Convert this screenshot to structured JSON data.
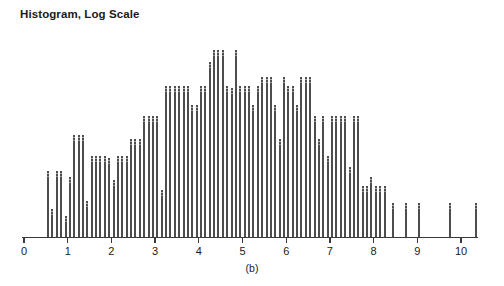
{
  "chart_data": {
    "type": "bar",
    "title": "Histogram, Log Scale",
    "subcaption": "(b)",
    "xlabel": "",
    "ylabel": "",
    "xlim": [
      0,
      10.6
    ],
    "ylim": [
      0,
      100
    ],
    "grid": false,
    "legend": null,
    "bin_width": 0.1,
    "bar_color": "#4d4d4d",
    "axis_color": "#3a3a3a",
    "background_color": "#ffffff",
    "x_tick_labels": [
      "0",
      "1",
      "2",
      "3",
      "4",
      "5",
      "6",
      "7",
      "8",
      "9",
      "10"
    ],
    "x_tick_values": [
      0,
      1,
      2,
      3,
      4,
      5,
      6,
      7,
      8,
      9,
      10
    ],
    "y_axis_visible": false,
    "note": "Counts are relative bar heights read off the plotted bars; vertical axis is unlabeled.",
    "x": [
      0.55,
      0.65,
      0.75,
      0.85,
      0.95,
      1.05,
      1.15,
      1.25,
      1.35,
      1.45,
      1.55,
      1.65,
      1.75,
      1.85,
      1.95,
      2.05,
      2.15,
      2.25,
      2.35,
      2.45,
      2.55,
      2.65,
      2.75,
      2.85,
      2.95,
      3.05,
      3.15,
      3.25,
      3.35,
      3.45,
      3.55,
      3.65,
      3.75,
      3.85,
      3.95,
      4.05,
      4.15,
      4.25,
      4.35,
      4.45,
      4.55,
      4.65,
      4.75,
      4.85,
      4.95,
      5.05,
      5.15,
      5.25,
      5.35,
      5.45,
      5.55,
      5.65,
      5.75,
      5.85,
      5.95,
      6.05,
      6.15,
      6.25,
      6.35,
      6.45,
      6.55,
      6.65,
      6.75,
      6.85,
      6.95,
      7.05,
      7.15,
      7.25,
      7.35,
      7.45,
      7.55,
      7.65,
      7.75,
      7.85,
      7.95,
      8.05,
      8.15,
      8.25,
      8.45,
      8.75,
      9.05,
      9.75,
      10.35
    ],
    "values": [
      31,
      13,
      31,
      31,
      10,
      28,
      48,
      48,
      48,
      17,
      38,
      38,
      38,
      38,
      37,
      27,
      38,
      38,
      38,
      46,
      46,
      46,
      57,
      57,
      57,
      57,
      22,
      71,
      71,
      71,
      71,
      71,
      71,
      62,
      62,
      71,
      71,
      82,
      88,
      88,
      88,
      71,
      70,
      88,
      71,
      71,
      71,
      62,
      71,
      75,
      75,
      75,
      62,
      46,
      75,
      71,
      71,
      62,
      75,
      75,
      75,
      57,
      46,
      57,
      38,
      57,
      57,
      57,
      57,
      33,
      57,
      57,
      24,
      24,
      28,
      24,
      24,
      24,
      16,
      16,
      16,
      16,
      16
    ],
    "peak_x": 4.35,
    "peak_value": 88,
    "n_bars": 82
  }
}
